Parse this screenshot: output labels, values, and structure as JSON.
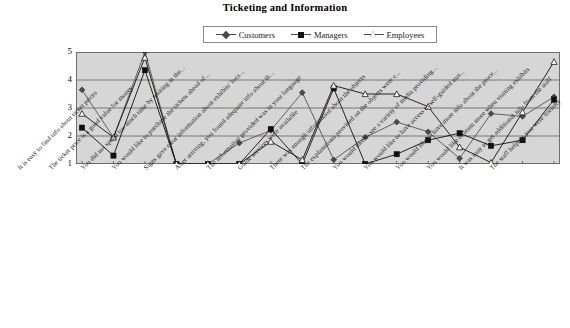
{
  "chart_data": {
    "type": "line",
    "title": "Ticketing and Information",
    "xlabel": "",
    "ylabel": "",
    "ylim": [
      1,
      5
    ],
    "yticks": [
      1,
      2,
      3,
      4,
      5
    ],
    "grid": true,
    "legend_position": "top-center",
    "categories": [
      "It is easy to find info about ticket prices",
      "The ticket price is a good value for money",
      "You did not spend too much time by waiting in the...",
      "You would like to purchase the tickets ahead of...",
      "Signs gave clear information about exhibits' loca...",
      "After arriving, you found adequate info about th...",
      "The information provided was in your language",
      "Guide services were available",
      "There was enough information about the objects",
      "The explanations provided on the objects were c...",
      "You would like to see a variety of media providing...",
      "You would like to have access to self-guided mat...",
      "You would like to have more info about the proce...",
      "You would like to learn more when visiting exhibits",
      "It was easy to get additional info from the staff",
      "The staff helping you were friendly"
    ],
    "series": [
      {
        "name": "Customers",
        "marker": "diamond",
        "color": "#4a4a4a",
        "values": [
          3.65,
          1.95,
          5.0,
          1.0,
          1.0,
          1.75,
          2.2,
          3.55,
          1.15,
          1.95,
          2.5,
          2.15,
          1.2,
          2.8,
          2.7,
          3.4
        ]
      },
      {
        "name": "Managers",
        "marker": "square",
        "color": "#111111",
        "values": [
          2.3,
          1.3,
          4.35,
          1.0,
          1.0,
          1.0,
          2.25,
          1.0,
          3.7,
          1.0,
          1.35,
          1.85,
          2.1,
          1.65,
          1.85,
          3.3
        ]
      },
      {
        "name": "Employees",
        "marker": "triangle",
        "color": "#ffffff",
        "values": [
          2.8,
          1.95,
          4.8,
          1.0,
          1.0,
          1.0,
          1.8,
          1.15,
          3.8,
          3.5,
          3.5,
          3.05,
          1.6,
          1.05,
          2.85,
          4.65
        ]
      }
    ]
  },
  "legend": {
    "items": [
      {
        "label": "Customers",
        "marker": "diamond"
      },
      {
        "label": "Managers",
        "marker": "square"
      },
      {
        "label": "Employees",
        "marker": "triangle"
      }
    ]
  }
}
